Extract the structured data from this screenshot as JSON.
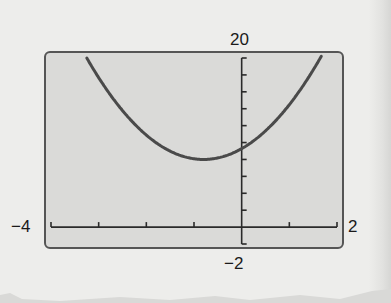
{
  "window": {
    "xmin": -4,
    "xmax": 2,
    "ymin": -2,
    "ymax": 20,
    "xscl": 1,
    "yscl": 2
  },
  "labels": {
    "ymax": "20",
    "ymin": "−2",
    "xmin": "−4",
    "xmax": "2"
  },
  "colors": {
    "screen_bg": "#dadad8",
    "screen_border": "#555555",
    "curve": "#4a4a4a",
    "axis": "#2a2a2a",
    "paper": "#ededeb"
  },
  "chart_data": {
    "type": "line",
    "title": "",
    "xlabel": "",
    "ylabel": "",
    "xlim": [
      -4,
      2
    ],
    "ylim": [
      -2,
      20
    ],
    "x_tick_step": 1,
    "y_tick_step": 2,
    "grid": false,
    "legend": null,
    "annotations": [
      "20",
      "−2",
      "−4",
      "2"
    ],
    "series": [
      {
        "name": "parabola",
        "description": "Upward-opening parabola, vertex near (-0.8, 8), y-intercept near 9",
        "x": [
          -3.2,
          -3.0,
          -2.5,
          -2.0,
          -1.5,
          -1.0,
          -0.8,
          -0.5,
          0.0,
          0.5,
          1.0,
          1.5,
          1.7
        ],
        "y": [
          19.5,
          17.7,
          13.8,
          10.9,
          9.0,
          8.1,
          8.0,
          8.2,
          9.3,
          11.4,
          14.5,
          18.6,
          20.5
        ]
      }
    ]
  }
}
